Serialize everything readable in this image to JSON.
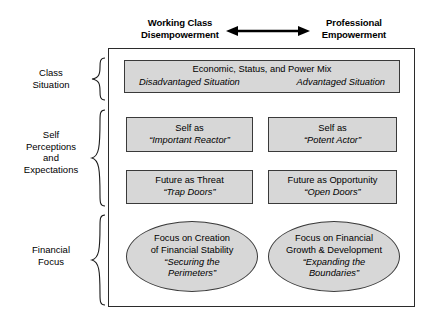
{
  "header": {
    "left_axis_label": "Working Class\nDisempowerment",
    "left_axis_line1": "Working Class",
    "left_axis_line2": "Disempowerment",
    "right_axis_line1": "Professional",
    "right_axis_line2": "Empowerment",
    "arrow_icon": "double-headed-horizontal-arrow"
  },
  "row_labels": [
    {
      "id": "class-situation",
      "line1": "Class",
      "line2": "Situation"
    },
    {
      "id": "self-perceptions",
      "line1": "Self",
      "line2": "Perceptions",
      "line3": "and",
      "line4": "Expectations"
    },
    {
      "id": "financial-focus",
      "line1": "Financial",
      "line2": "Focus"
    }
  ],
  "braces": [
    {
      "id": "brace-class-situation",
      "icon": "curly-brace-icon"
    },
    {
      "id": "brace-self-perceptions",
      "icon": "curly-brace-icon"
    },
    {
      "id": "brace-financial-focus",
      "icon": "curly-brace-icon"
    }
  ],
  "rows": {
    "class_situation": {
      "title": "Economic, Status, and Power Mix",
      "left_sub": "Disadvantaged Situation",
      "right_sub": "Advantaged Situation"
    },
    "self_perceptions": {
      "left_box": {
        "line1": "Self as",
        "line2": "“Important Reactor”"
      },
      "right_box": {
        "line1": "Self as",
        "line2": "“Potent Actor”"
      }
    },
    "future_expectations": {
      "left_box": {
        "line1": "Future as Threat",
        "line2": "“Trap Doors”"
      },
      "right_box": {
        "line1": "Future as Opportunity",
        "line2": "“Open Doors”"
      }
    },
    "financial_focus": {
      "left_ellipse": {
        "line1": "Focus on Creation",
        "line2": "of Financial Stability",
        "line3": "“Securing the",
        "line4": "Perimeters”"
      },
      "right_ellipse": {
        "line1": "Focus on Financial",
        "line2": "Growth & Development",
        "line3": "“Expanding the",
        "line4": "Boundaries”"
      }
    }
  },
  "colors": {
    "shape_fill": "#d7d7d7",
    "shape_stroke": "#3a3a3a",
    "frame_stroke": "#2b2b2b",
    "text": "#000000",
    "background": "#ffffff"
  }
}
